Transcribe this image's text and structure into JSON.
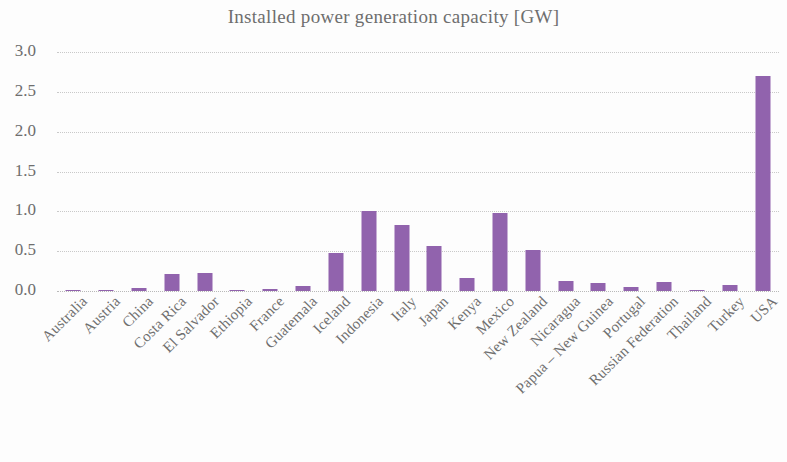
{
  "chart_data": {
    "type": "bar",
    "title": "Installed power generation capacity [GW]",
    "xlabel": "",
    "ylabel": "",
    "ylim": [
      0,
      3.0
    ],
    "ytick_step": 0.5,
    "ytick_labels": [
      "3.0",
      "2.5",
      "2.0",
      "1.5",
      "1.0",
      "0.5",
      "0.0"
    ],
    "ytick_values": [
      3.0,
      2.5,
      2.0,
      1.5,
      1.0,
      0.5,
      0.0
    ],
    "grid": true,
    "grid_axis": "y",
    "grid_style": "dotted",
    "legend": false,
    "bar_color": "#9163ad",
    "categories": [
      "Australia",
      "Austria",
      "China",
      "Costa Rica",
      "El Salvador",
      "Ethiopia",
      "France",
      "Guatemala",
      "Iceland",
      "Indonesia",
      "Italy",
      "Japan",
      "Kenya",
      "Mexico",
      "New Zealand",
      "Nicaragua",
      "Papua – New Guinea",
      "Portugal",
      "Russian Federation",
      "Thailand",
      "Turkey",
      "USA"
    ],
    "values": [
      0.01,
      0.01,
      0.04,
      0.21,
      0.23,
      0.01,
      0.02,
      0.06,
      0.48,
      1.01,
      0.83,
      0.56,
      0.16,
      0.98,
      0.51,
      0.13,
      0.1,
      0.05,
      0.11,
      0.01,
      0.07,
      2.7
    ]
  },
  "colors": {
    "bar": "#9163ad",
    "text": "#6e6e6e",
    "grid": "#c9c9c9",
    "background": "#fdfdfd"
  }
}
